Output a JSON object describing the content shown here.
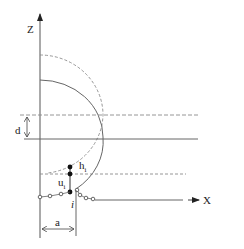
{
  "diagram": {
    "axes": {
      "z_label": "Z",
      "x_label": "X"
    },
    "dimensions": {
      "d_label": "d",
      "a_label": "a"
    },
    "annotations": {
      "h_label": "h",
      "h_subscript": "i",
      "u_label": "u",
      "u_subscript": "i",
      "i_label": "i"
    },
    "colors": {
      "line": "#555555",
      "dashed": "#8a8a8a",
      "dot": "#111111",
      "text": "#222222"
    }
  }
}
